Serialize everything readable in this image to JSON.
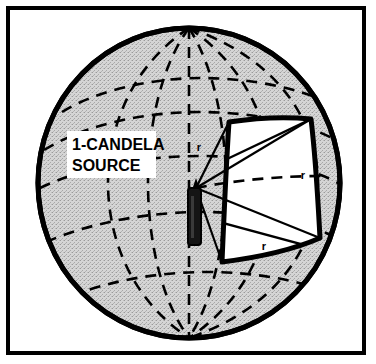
{
  "figure": {
    "frame": {
      "border_color": "#000000",
      "background_color": "#ffffff"
    },
    "sphere": {
      "name": "sphere",
      "fill_color": "#c9c9c9",
      "outline_color": "#000000",
      "grid_style": "dashed",
      "center_x": 189,
      "center_y": 183,
      "radius_x": 151,
      "radius_y": 155
    },
    "patch": {
      "name": "unit-solid-angle-patch",
      "fill_color": "#ffffff",
      "outline_color": "#000000",
      "description": "curved square area of one steradian on sphere surface"
    },
    "source": {
      "name": "candle-source",
      "color": "#000000",
      "label_line1": "1-CANDELA",
      "label_line2": "SOURCE",
      "label_box_fill": "#ffffff"
    },
    "radius_labels": [
      {
        "text": "r",
        "x": 199,
        "y": 151
      },
      {
        "text": "r",
        "x": 303,
        "y": 179
      },
      {
        "text": "r",
        "x": 264,
        "y": 250
      }
    ]
  }
}
